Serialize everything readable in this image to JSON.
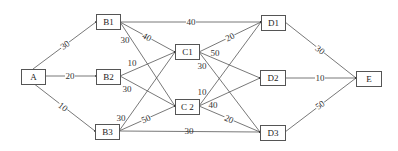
{
  "diagram": {
    "type": "weighted-directed-graph",
    "nodes": [
      {
        "id": "A",
        "label": "A",
        "x": 21,
        "y": 69,
        "w": 24,
        "h": 15
      },
      {
        "id": "B1",
        "label": "B1",
        "x": 96,
        "y": 14,
        "w": 24,
        "h": 15
      },
      {
        "id": "B2",
        "label": "B2",
        "x": 96,
        "y": 69,
        "w": 24,
        "h": 15
      },
      {
        "id": "B3",
        "label": "B3",
        "x": 95,
        "y": 124,
        "w": 24,
        "h": 15
      },
      {
        "id": "C1",
        "label": "C1",
        "x": 175,
        "y": 44,
        "w": 24,
        "h": 15
      },
      {
        "id": "C2",
        "label": "C 2",
        "x": 175,
        "y": 99,
        "w": 24,
        "h": 15
      },
      {
        "id": "D1",
        "label": "D1",
        "x": 261,
        "y": 15,
        "w": 24,
        "h": 15
      },
      {
        "id": "D2",
        "label": "D2",
        "x": 260,
        "y": 70,
        "w": 25,
        "h": 15
      },
      {
        "id": "D3",
        "label": "D3",
        "x": 260,
        "y": 125,
        "w": 25,
        "h": 15
      },
      {
        "id": "E",
        "label": "E",
        "x": 356,
        "y": 71,
        "w": 25,
        "h": 15
      }
    ],
    "edges": [
      {
        "from": "A",
        "to": "B1",
        "weight": "30",
        "x1": 33,
        "y1": 69,
        "x2": 96,
        "y2": 22,
        "lx": 65,
        "ly": 45,
        "rot": -37
      },
      {
        "from": "A",
        "to": "B2",
        "weight": "20",
        "x1": 45,
        "y1": 76,
        "x2": 96,
        "y2": 76,
        "lx": 70,
        "ly": 76,
        "rot": 0
      },
      {
        "from": "A",
        "to": "B3",
        "weight": "10",
        "x1": 33,
        "y1": 83,
        "x2": 95,
        "y2": 131,
        "lx": 63,
        "ly": 107,
        "rot": 38
      },
      {
        "from": "B1",
        "to": "D1",
        "weight": "40",
        "x1": 120,
        "y1": 22,
        "x2": 261,
        "y2": 22,
        "lx": 191,
        "ly": 22,
        "rot": 0
      },
      {
        "from": "B1",
        "to": "C1",
        "weight": "40",
        "x1": 120,
        "y1": 22,
        "x2": 175,
        "y2": 52,
        "lx": 147,
        "ly": 37,
        "rot": 28
      },
      {
        "from": "B1",
        "to": "C2",
        "weight": "30",
        "x1": 120,
        "y1": 22,
        "x2": 175,
        "y2": 106,
        "lx": 125,
        "ly": 40,
        "rot": 0
      },
      {
        "from": "B2",
        "to": "C1",
        "weight": "10",
        "x1": 120,
        "y1": 76,
        "x2": 175,
        "y2": 52,
        "lx": 132,
        "ly": 63,
        "rot": 0
      },
      {
        "from": "B2",
        "to": "C2",
        "weight": "30",
        "x1": 120,
        "y1": 76,
        "x2": 175,
        "y2": 106,
        "lx": 127,
        "ly": 89,
        "rot": 0
      },
      {
        "from": "B3",
        "to": "C1",
        "weight": "30",
        "x1": 119,
        "y1": 131,
        "x2": 175,
        "y2": 52,
        "lx": 121,
        "ly": 118,
        "rot": 0
      },
      {
        "from": "B3",
        "to": "C2",
        "weight": "50",
        "x1": 119,
        "y1": 131,
        "x2": 175,
        "y2": 106,
        "lx": 146,
        "ly": 119,
        "rot": -24
      },
      {
        "from": "B3",
        "to": "D3",
        "weight": "30",
        "x1": 119,
        "y1": 131,
        "x2": 260,
        "y2": 132,
        "lx": 189,
        "ly": 131,
        "rot": 0
      },
      {
        "from": "C1",
        "to": "D1",
        "weight": "20",
        "x1": 199,
        "y1": 52,
        "x2": 261,
        "y2": 22,
        "lx": 230,
        "ly": 37,
        "rot": -26
      },
      {
        "from": "C1",
        "to": "D2",
        "weight": "50",
        "x1": 199,
        "y1": 52,
        "x2": 260,
        "y2": 78,
        "lx": 215,
        "ly": 53,
        "rot": 0
      },
      {
        "from": "C1",
        "to": "D3",
        "weight": "30",
        "x1": 199,
        "y1": 52,
        "x2": 260,
        "y2": 132,
        "lx": 202,
        "ly": 66,
        "rot": 0
      },
      {
        "from": "C2",
        "to": "D1",
        "weight": "10",
        "x1": 199,
        "y1": 106,
        "x2": 261,
        "y2": 22,
        "lx": 202,
        "ly": 92,
        "rot": 0
      },
      {
        "from": "C2",
        "to": "D2",
        "weight": "40",
        "x1": 199,
        "y1": 106,
        "x2": 260,
        "y2": 78,
        "lx": 213,
        "ly": 105,
        "rot": 0
      },
      {
        "from": "C2",
        "to": "D3",
        "weight": "20",
        "x1": 199,
        "y1": 106,
        "x2": 260,
        "y2": 132,
        "lx": 229,
        "ly": 119,
        "rot": 24
      },
      {
        "from": "D1",
        "to": "E",
        "weight": "30",
        "x1": 285,
        "y1": 22,
        "x2": 356,
        "y2": 78,
        "lx": 320,
        "ly": 50,
        "rot": 38
      },
      {
        "from": "D2",
        "to": "E",
        "weight": "10",
        "x1": 285,
        "y1": 78,
        "x2": 356,
        "y2": 78,
        "lx": 320,
        "ly": 78,
        "rot": 0
      },
      {
        "from": "D3",
        "to": "E",
        "weight": "50",
        "x1": 285,
        "y1": 132,
        "x2": 356,
        "y2": 78,
        "lx": 320,
        "ly": 105,
        "rot": -37
      }
    ]
  }
}
